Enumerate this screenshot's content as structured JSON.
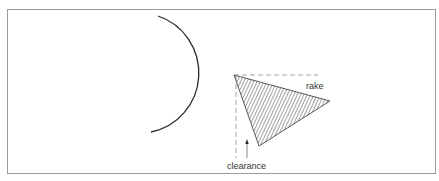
{
  "diagram": {
    "type": "cutting-tool-angles",
    "labels": {
      "rake": "rake",
      "clearance": "clearance"
    },
    "colors": {
      "stroke": "#2a2a2a",
      "frame": "#9a9a9a",
      "dash": "#8a8a8a",
      "hatch": "#444444",
      "background": "#ffffff"
    }
  }
}
